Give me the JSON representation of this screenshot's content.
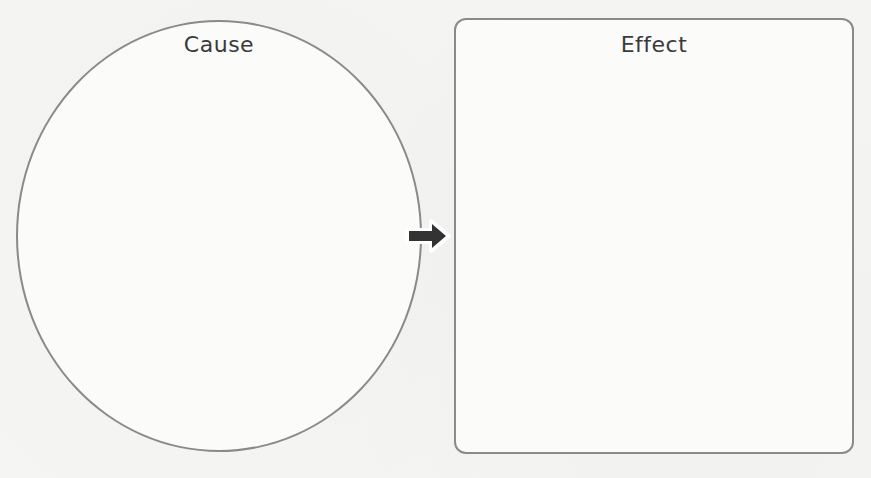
{
  "diagram": {
    "type": "cause-and-effect graphic organizer",
    "cause": {
      "label": "Cause",
      "shape": "oval"
    },
    "effect": {
      "label": "Effect",
      "shape": "rounded-rectangle"
    },
    "connector": {
      "icon": "arrow-right-icon",
      "direction": "cause-to-effect",
      "color": "#333333"
    },
    "colors": {
      "outline": "#8a8a8a",
      "text": "#3a3a3a",
      "background": "#f5f5f3"
    }
  }
}
